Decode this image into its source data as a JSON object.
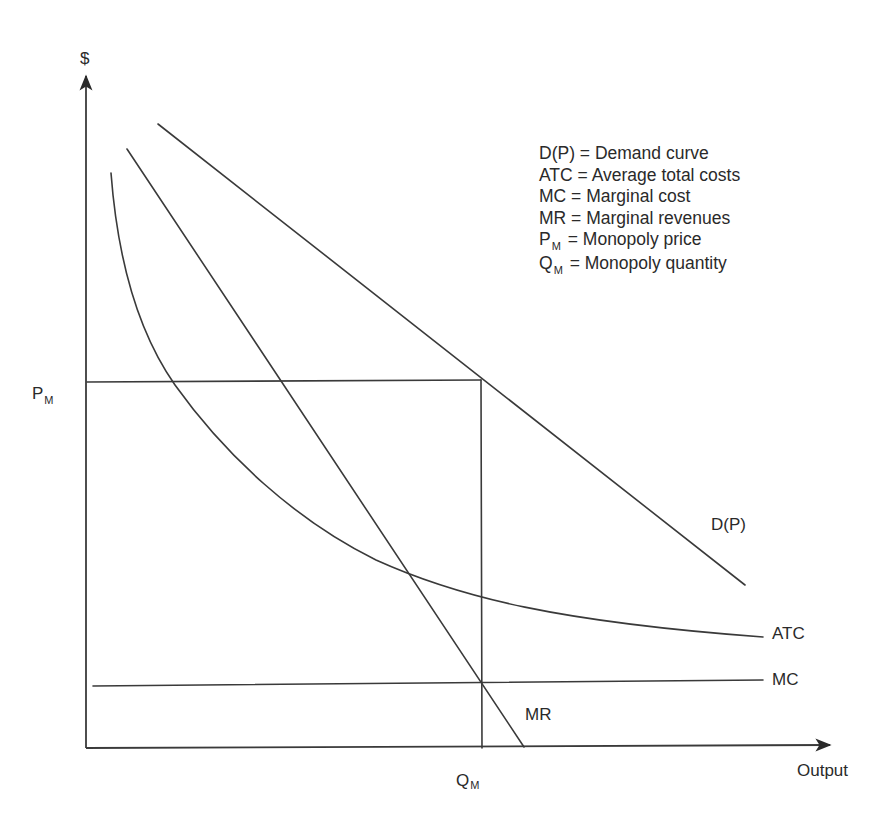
{
  "diagram": {
    "y_axis_label": "$",
    "x_axis_label": "Output",
    "curve_labels": {
      "demand": "D(P)",
      "atc": "ATC",
      "mc": "MC",
      "mr": "MR"
    },
    "price_marker": {
      "main": "P",
      "sub": "M"
    },
    "quantity_marker": {
      "main": "Q",
      "sub": "M"
    },
    "legend": [
      {
        "symbol": "D(P)",
        "sub": "",
        "text": "= Demand curve"
      },
      {
        "symbol": "ATC",
        "sub": "",
        "text": "= Average total costs"
      },
      {
        "symbol": "MC",
        "sub": "",
        "text": "= Marginal cost"
      },
      {
        "symbol": "MR",
        "sub": "",
        "text": "= Marginal revenues"
      },
      {
        "symbol": "P",
        "sub": "M",
        "text": "= Monopoly price"
      },
      {
        "symbol": "Q",
        "sub": "M",
        "text": "= Monopoly quantity"
      }
    ],
    "line_color": "#3a3a3a",
    "text_color": "#2a2a2a"
  }
}
